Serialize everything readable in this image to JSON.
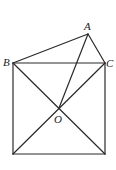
{
  "diagram": {
    "type": "geometry",
    "stroke_color": "#2a2a2a",
    "points": {
      "A": {
        "label": "A",
        "x": 88,
        "y": 34
      },
      "B": {
        "label": "B",
        "x": 13,
        "y": 63
      },
      "C": {
        "label": "C",
        "x": 105,
        "y": 63
      },
      "O": {
        "label": "O",
        "x": 59,
        "y": 108
      },
      "D": {
        "label": "",
        "x": 13,
        "y": 154
      },
      "E": {
        "label": "",
        "x": 105,
        "y": 154
      }
    },
    "segments": [
      [
        "A",
        "B"
      ],
      [
        "A",
        "C"
      ],
      [
        "B",
        "C"
      ],
      [
        "A",
        "O"
      ],
      [
        "B",
        "D"
      ],
      [
        "C",
        "E"
      ],
      [
        "D",
        "E"
      ],
      [
        "B",
        "E"
      ],
      [
        "C",
        "D"
      ]
    ],
    "labels": {
      "A": "A",
      "B": "B",
      "C": "C",
      "O": "O"
    }
  }
}
